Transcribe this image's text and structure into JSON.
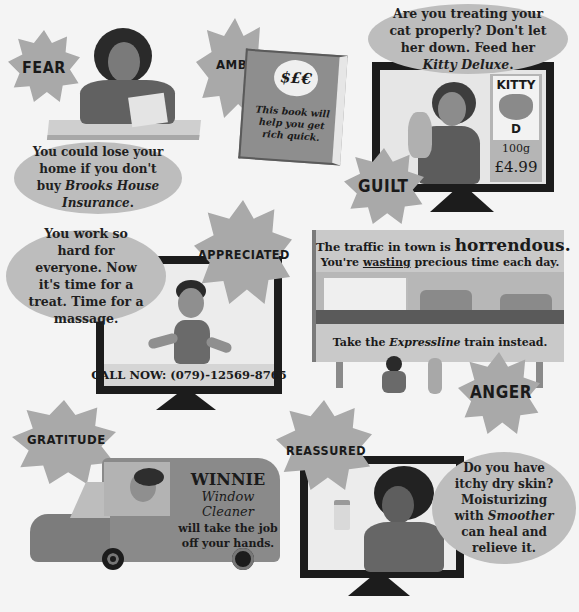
{
  "panels": {
    "fear": {
      "label": "FEAR",
      "bubble_text_1": "You could lose your home if you don't buy ",
      "bubble_brand": "Brooks House Insurance",
      "bubble_text_2": "."
    },
    "ambition": {
      "label": "AMBITION",
      "book_symbol": "$£€",
      "book_text": "This book will help you get rich quick."
    },
    "guilt": {
      "label": "GUILT",
      "bubble_text_1": "Are you treating your cat properly? Don't let her down. Feed her ",
      "bubble_brand": "Kitty Deluxe",
      "bubble_text_2": ".",
      "product_name_top": "KITTY",
      "product_name_bottom": "D",
      "product_weight": "100g",
      "product_price": "£4.99"
    },
    "appreciated": {
      "label": "APPRECIATED",
      "bubble_text": "You work so hard for everyone. Now it's time for a treat. Time for a massage.",
      "call_banner": "CALL NOW: (079)-12569-8765"
    },
    "anger": {
      "label": "ANGER",
      "billboard_line1_prefix": "The traffic in town is ",
      "billboard_line1_emphasis": "horrendous.",
      "billboard_line2_prefix": "You're ",
      "billboard_line2_underlined": "wasting",
      "billboard_line2_suffix": " precious time each day.",
      "billboard_line3_prefix": "Take the ",
      "billboard_line3_brand": "Expressline",
      "billboard_line3_suffix": " train instead."
    },
    "gratitude": {
      "label": "GRATITUDE",
      "van_title": "WINNIE",
      "van_subtitle": "Window Cleaner",
      "van_text": "will take the job off your hands."
    },
    "reassured": {
      "label": "REASSURED",
      "bubble_text_1": "Do you have itchy dry skin? Moisturizing with ",
      "bubble_brand": "Smoother",
      "bubble_text_2": " can heal and relieve it."
    }
  },
  "colors": {
    "background": "#f4f4f4",
    "star": "#a9a9a9",
    "bubble": "#bdbdbd",
    "monitor": "#1c1c1c",
    "text": "#1a1a1a"
  }
}
